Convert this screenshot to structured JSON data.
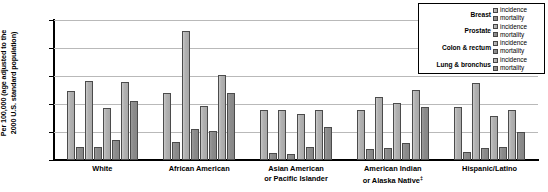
{
  "chart_data": {
    "type": "bar",
    "title": "",
    "xlabel": "",
    "ylabel": "Per 100,000 (age adjusted to the 2000 U.S. standard population)",
    "ylim": [
      0,
      250
    ],
    "yticks": [
      0,
      50,
      100,
      150,
      200,
      250
    ],
    "grid": true,
    "legend_position": "top-right",
    "categories": [
      "White",
      "African American",
      "Asian American or Pacific Islander",
      "American Indian or Alaska Native‡",
      "Hispanic/Latino"
    ],
    "series": [
      {
        "name": "Breast incidence",
        "cancer": "Breast",
        "measure": "incidence",
        "values": [
          123,
          119,
          89,
          90,
          94
        ]
      },
      {
        "name": "Breast mortality",
        "cancer": "Breast",
        "measure": "mortality",
        "values": [
          24,
          33,
          12,
          19,
          15
        ]
      },
      {
        "name": "Prostate incidence",
        "cancer": "Prostate",
        "measure": "incidence",
        "values": [
          141,
          230,
          89,
          113,
          137
        ]
      },
      {
        "name": "Prostate mortality",
        "cancer": "Prostate",
        "measure": "mortality",
        "values": [
          24,
          56,
          11,
          21,
          22
        ]
      },
      {
        "name": "Colon & rectum incidence",
        "cancer": "Colon & rectum",
        "measure": "incidence",
        "values": [
          93,
          97,
          82,
          101,
          78
        ]
      },
      {
        "name": "Colon & rectum mortality",
        "cancer": "Colon & rectum",
        "measure": "mortality",
        "values": [
          35,
          51,
          23,
          30,
          24
        ]
      },
      {
        "name": "Lung & bronchus incidence",
        "cancer": "Lung & bronchus",
        "measure": "incidence",
        "values": [
          140,
          152,
          89,
          125,
          89
        ]
      },
      {
        "name": "Lung & bronchus mortality",
        "cancer": "Lung & bronchus",
        "measure": "mortality",
        "values": [
          106,
          120,
          59,
          94,
          50
        ]
      }
    ]
  },
  "legend": {
    "rows": [
      {
        "category": "Breast",
        "incidence_label": "incidence",
        "mortality_label": "mortality"
      },
      {
        "category": "Prostate",
        "incidence_label": "incidence",
        "mortality_label": "mortality"
      },
      {
        "category": "Colon & rectum",
        "incidence_label": "incidence",
        "mortality_label": "mortality"
      },
      {
        "category": "Lung & bronchus",
        "incidence_label": "incidence",
        "mortality_label": "mortality"
      }
    ]
  },
  "axis": {
    "ylabel_line1": "Per 100,000 (age adjusted to the",
    "ylabel_line2": "2000 U.S. standard population)"
  },
  "xlabels": [
    {
      "line1": "White",
      "line2": ""
    },
    {
      "line1": "African American",
      "line2": ""
    },
    {
      "line1": "Asian American",
      "line2": "or Pacific Islander"
    },
    {
      "line1": "American Indian",
      "line2": "or Alaska Native‡"
    },
    {
      "line1": "Hispanic/Latino",
      "line2": ""
    }
  ],
  "colors": {
    "incidence": "#b2b2b2",
    "mortality": "#8b8b8b",
    "grid": "#b9b9b9",
    "axis": "#000000"
  }
}
